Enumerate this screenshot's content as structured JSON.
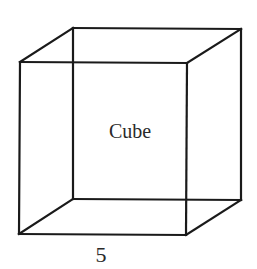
{
  "diagram": {
    "type": "wireframe-cube",
    "shape_label": "Cube",
    "edge_label": "5",
    "stroke_color": "#1a1a1a",
    "text_color": "#2a2a2a",
    "background": "#ffffff",
    "vertices": {
      "front_top_left": [
        20,
        62
      ],
      "front_top_right": [
        187,
        63
      ],
      "front_bottom_left": [
        19,
        234
      ],
      "front_bottom_right": [
        186,
        235
      ],
      "back_top_left": [
        73,
        28
      ],
      "back_top_right": [
        241,
        29
      ],
      "back_bottom_left": [
        73,
        199
      ],
      "back_bottom_right": [
        241,
        200
      ]
    }
  }
}
